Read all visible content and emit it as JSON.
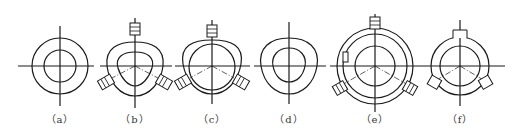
{
  "figure": {
    "panels": [
      {
        "id": "a",
        "label": "（a）",
        "description": "Two concentric circles with centerlines"
      },
      {
        "id": "b",
        "label": "（b）",
        "description": "Rounded-triangle ring with three clamping blocks at 120°"
      },
      {
        "id": "c",
        "label": "（c）",
        "description": "Rounded-triangle outer contour with inner circle and three clamping blocks"
      },
      {
        "id": "d",
        "label": "（d）",
        "description": "Rounded-triangle ring, no clamps"
      },
      {
        "id": "e",
        "label": "（e）",
        "description": "Three concentric circles with notches and three clamping blocks"
      },
      {
        "id": "f",
        "label": "（f）",
        "description": "Concentric circles with three radial lugs"
      }
    ],
    "colors": {
      "line": "#1a1a1a",
      "background": "#ffffff",
      "caption": "#333333"
    }
  }
}
